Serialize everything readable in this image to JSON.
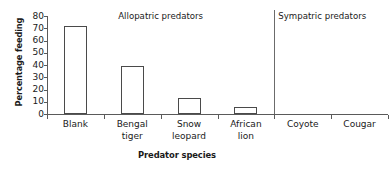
{
  "chart_data": {
    "type": "bar",
    "title": "",
    "xlabel": "Predator species",
    "ylabel": "Percentage feeding",
    "categories": [
      "Blank",
      "Bengal tiger",
      "Snow leopard",
      "African lion",
      "Coyote",
      "Cougar"
    ],
    "values": [
      72,
      39,
      13,
      6,
      0,
      0
    ],
    "ylim": [
      0,
      80
    ],
    "yticks": [
      0,
      10,
      20,
      30,
      40,
      50,
      60,
      70,
      80
    ],
    "ytick_labels": [
      "0",
      "10",
      "20",
      "30",
      "40",
      "50",
      "60",
      "70",
      "80"
    ],
    "grid": false,
    "legend": "none",
    "bar_style": {
      "fill": "#ffffff",
      "edge": "#4a4a4a"
    },
    "annotations": [
      {
        "text": "Allopatric predators",
        "group": "allopatric"
      },
      {
        "text": "Sympatric predators",
        "group": "sympatric"
      }
    ],
    "groups": [
      {
        "name": "Allopatric predators",
        "categories": [
          "Blank",
          "Bengal tiger",
          "Snow leopard",
          "African lion"
        ]
      },
      {
        "name": "Sympatric predators",
        "categories": [
          "Coyote",
          "Cougar"
        ]
      }
    ],
    "divider_after_category": "African lion"
  },
  "axis": {
    "y_title": "Percentage feeding",
    "x_title": "Predator species"
  },
  "colors": {
    "axis": "#5a5a5a",
    "bar_edge": "#4a4a4a",
    "bar_fill": "#ffffff",
    "divider": "#6b6b6b",
    "text": "#1a1a1a",
    "background": "#ffffff"
  }
}
